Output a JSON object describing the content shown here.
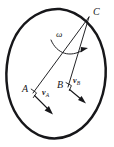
{
  "figure": {
    "kind": "rigid-body-kinematics-diagram",
    "background_color": "#ffffff",
    "ink_color": "#17171a",
    "outline_stroke_width": 2.4,
    "line_stroke_width": 1.0,
    "labels": {
      "point_c": "C",
      "point_a": "A",
      "point_b": "B",
      "angular_velocity": "ω",
      "velocity_a": "v",
      "velocity_a_sub": "A",
      "velocity_b": "v",
      "velocity_b_sub": "B"
    },
    "points": {
      "C": {
        "x": 89,
        "y": 17
      },
      "A": {
        "x": 33,
        "y": 93
      },
      "B": {
        "x": 68,
        "y": 87
      }
    },
    "vectors": {
      "v_A": {
        "from_x": 33,
        "from_y": 93,
        "to_x": 52,
        "to_y": 113
      },
      "v_B": {
        "from_x": 68,
        "from_y": 87,
        "to_x": 85,
        "to_y": 102
      }
    },
    "omega_arc": {
      "start_x": 51,
      "start_y": 40,
      "end_x": 86,
      "end_y": 50,
      "arrow_direction": "clockwise-right"
    },
    "body_outline": {
      "shape": "tilted closed oval / potato",
      "cx": 55,
      "cy": 75,
      "rx": 48,
      "ry": 68,
      "rotation_deg": -22
    }
  }
}
